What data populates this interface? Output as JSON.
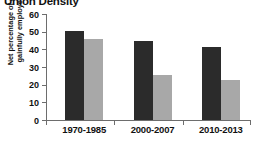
{
  "chart_data": {
    "type": "bar",
    "title": "Union Density",
    "xlabel": "",
    "ylabel": "Net percentage of all gainfully employed",
    "ylim": [
      0,
      60
    ],
    "yticks": [
      0,
      10,
      20,
      30,
      40,
      50,
      60
    ],
    "grid": false,
    "legend": "none",
    "categories": [
      "1970-1985",
      "2000-2007",
      "2010-2013"
    ],
    "series": [
      {
        "name": "series-dark",
        "color": "#2b2b2b",
        "values": [
          50.5,
          44.7,
          41.3
        ]
      },
      {
        "name": "series-light",
        "color": "#a8a8a8",
        "values": [
          46.0,
          25.5,
          22.5
        ]
      }
    ]
  },
  "axis": {
    "tick_labels": [
      "60",
      "50",
      "40",
      "30",
      "20",
      "10",
      "0"
    ],
    "line_color": "#6d6d6d"
  }
}
